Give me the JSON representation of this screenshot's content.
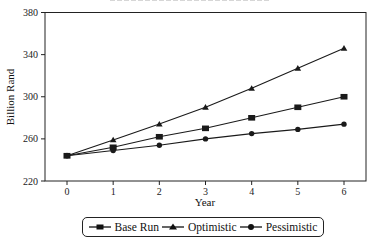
{
  "chart_data": {
    "type": "line",
    "title": "",
    "xlabel": "Year",
    "ylabel": "Billion Rand",
    "x": [
      0,
      1,
      2,
      3,
      4,
      5,
      6
    ],
    "xticks": [
      "0",
      "1",
      "2",
      "3",
      "4",
      "5",
      "6"
    ],
    "yticks": [
      "220",
      "260",
      "300",
      "340",
      "380"
    ],
    "ylim": [
      220,
      380
    ],
    "xlim": [
      -0.5,
      6.5
    ],
    "grid": false,
    "legend_position": "bottom",
    "series": [
      {
        "name": "Base Run",
        "marker": "square",
        "values": [
          244,
          252,
          262,
          270,
          280,
          290,
          300
        ]
      },
      {
        "name": "Optimistic",
        "marker": "triangle",
        "values": [
          244,
          259,
          274,
          290,
          308,
          327,
          346
        ]
      },
      {
        "name": "Pessimistic",
        "marker": "circle",
        "values": [
          244,
          249,
          254,
          260,
          265,
          269,
          274
        ]
      }
    ]
  },
  "colors": {
    "line": "#1a1a1a",
    "axis": "#222222",
    "background": "#ffffff"
  }
}
